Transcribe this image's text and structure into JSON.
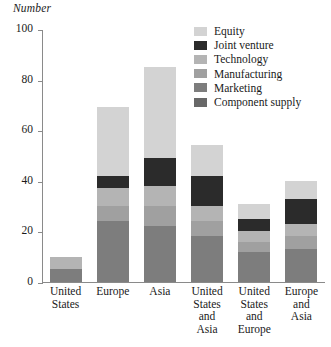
{
  "chart_data": {
    "type": "bar",
    "stacked": true,
    "title": "",
    "subtitle": "",
    "ylabel": "Number",
    "xlabel": "",
    "ylim": [
      0,
      100
    ],
    "yticks": [
      0,
      20,
      40,
      60,
      80,
      100
    ],
    "ytick_labels": [
      "0",
      "20",
      "40",
      "60",
      "80",
      "100"
    ],
    "grid": false,
    "legend_position": "top-right",
    "categories": [
      "United\nStates",
      "Europe",
      "Asia",
      "United\nStates\nand\nAsia",
      "United\nStates\nand\nEurope",
      "Europe\nand\nAsia"
    ],
    "series": [
      {
        "name": "Equity",
        "color": "#d3d3d3",
        "values": [
          0,
          27,
          36,
          12,
          6,
          7
        ]
      },
      {
        "name": "Joint venture",
        "color": "#2b2b2b",
        "values": [
          0,
          5,
          11,
          12,
          5,
          10
        ]
      },
      {
        "name": "Technology",
        "color": "#b4b4b4",
        "values": [
          5,
          7,
          8,
          6,
          4,
          5
        ]
      },
      {
        "name": "Manufacturing",
        "color": "#a0a0a0",
        "values": [
          0,
          6,
          8,
          6,
          4,
          5
        ]
      },
      {
        "name": "Marketing",
        "color": "#7d7d7d",
        "values": [
          5,
          24,
          22,
          18,
          12,
          13
        ]
      },
      {
        "name": "Component supply",
        "color": "#686868",
        "values": [
          0,
          0,
          0,
          0,
          0,
          0
        ]
      }
    ],
    "totals": [
      10,
      69,
      85,
      54,
      31,
      40
    ]
  },
  "legend": {
    "items": [
      {
        "label": "Equity",
        "color": "#d3d3d3"
      },
      {
        "label": "Joint venture",
        "color": "#2b2b2b"
      },
      {
        "label": "Technology",
        "color": "#b4b4b4"
      },
      {
        "label": "Manufacturing",
        "color": "#a0a0a0"
      },
      {
        "label": "Marketing",
        "color": "#7d7d7d"
      },
      {
        "label": "Component supply",
        "color": "#686868"
      }
    ]
  },
  "axes": {
    "y_title": "Number",
    "axis_color": "#8a8a8a"
  }
}
